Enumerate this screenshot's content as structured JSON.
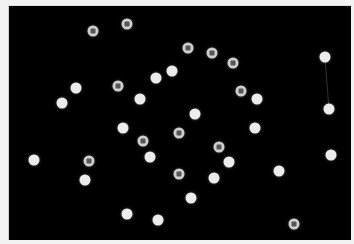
{
  "canvas": {
    "background": "#000000",
    "dot_color": "#ececec",
    "ring_color": "#cfcfcf"
  },
  "dots": [
    {
      "x": 62,
      "y": 103,
      "kind": "solid"
    },
    {
      "x": 76,
      "y": 88,
      "kind": "solid"
    },
    {
      "x": 34,
      "y": 160,
      "kind": "solid"
    },
    {
      "x": 85,
      "y": 180,
      "kind": "solid"
    },
    {
      "x": 123,
      "y": 128,
      "kind": "solid"
    },
    {
      "x": 140,
      "y": 99,
      "kind": "solid"
    },
    {
      "x": 156,
      "y": 78,
      "kind": "solid"
    },
    {
      "x": 172,
      "y": 71,
      "kind": "solid"
    },
    {
      "x": 150,
      "y": 157,
      "kind": "solid"
    },
    {
      "x": 127,
      "y": 214,
      "kind": "solid"
    },
    {
      "x": 158,
      "y": 220,
      "kind": "solid"
    },
    {
      "x": 191,
      "y": 198,
      "kind": "solid"
    },
    {
      "x": 195,
      "y": 114,
      "kind": "solid"
    },
    {
      "x": 214,
      "y": 178,
      "kind": "solid"
    },
    {
      "x": 229,
      "y": 162,
      "kind": "solid"
    },
    {
      "x": 255,
      "y": 128,
      "kind": "solid"
    },
    {
      "x": 257,
      "y": 99,
      "kind": "solid"
    },
    {
      "x": 279,
      "y": 171,
      "kind": "solid"
    },
    {
      "x": 325,
      "y": 57,
      "kind": "solid"
    },
    {
      "x": 329,
      "y": 109,
      "kind": "solid"
    },
    {
      "x": 331,
      "y": 155,
      "kind": "solid"
    },
    {
      "x": 93,
      "y": 31,
      "kind": "ringed"
    },
    {
      "x": 127,
      "y": 24,
      "kind": "ringed"
    },
    {
      "x": 118,
      "y": 86,
      "kind": "ringed"
    },
    {
      "x": 188,
      "y": 48,
      "kind": "ringed"
    },
    {
      "x": 212,
      "y": 53,
      "kind": "ringed"
    },
    {
      "x": 233,
      "y": 63,
      "kind": "ringed"
    },
    {
      "x": 241,
      "y": 91,
      "kind": "ringed"
    },
    {
      "x": 143,
      "y": 141,
      "kind": "ringed"
    },
    {
      "x": 179,
      "y": 133,
      "kind": "ringed"
    },
    {
      "x": 89,
      "y": 161,
      "kind": "ringed"
    },
    {
      "x": 219,
      "y": 147,
      "kind": "ringed"
    },
    {
      "x": 179,
      "y": 174,
      "kind": "ringed"
    },
    {
      "x": 294,
      "y": 224,
      "kind": "ringed"
    }
  ],
  "links": [
    {
      "x1": 325,
      "y1": 57,
      "x2": 329,
      "y2": 109
    }
  ]
}
